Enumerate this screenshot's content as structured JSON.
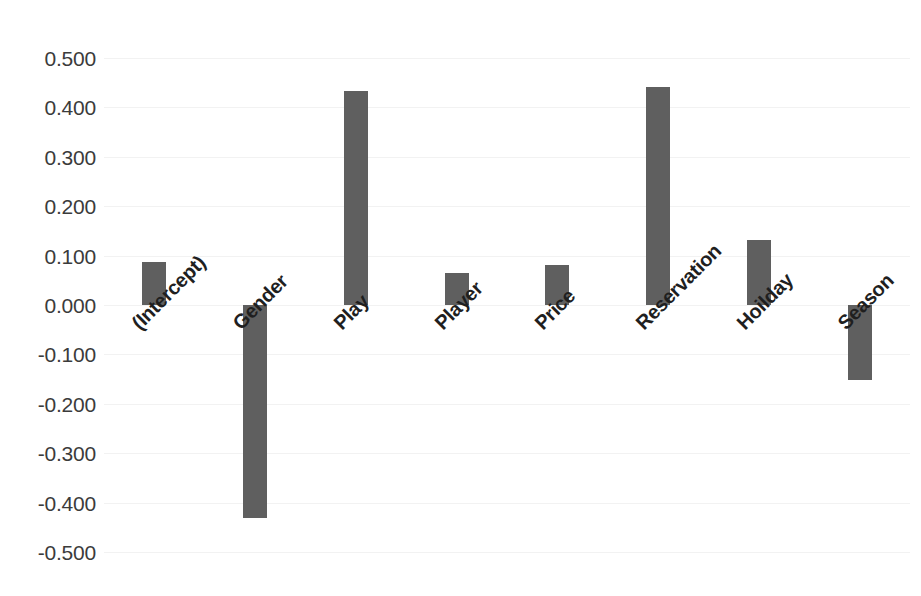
{
  "chart_data": {
    "type": "bar",
    "title": "",
    "subtitle": "",
    "xlabel": "",
    "ylabel": "",
    "categories": [
      "(Intercept)",
      "Gender",
      "Play",
      "Player",
      "Price",
      "Reservation",
      "Hoilday",
      "Season"
    ],
    "values": [
      0.088,
      -0.431,
      0.433,
      0.064,
      0.08,
      0.441,
      0.132,
      -0.151
    ],
    "ylim": [
      -0.5,
      0.5
    ],
    "yticks": [
      0.5,
      0.4,
      0.3,
      0.2,
      0.1,
      0.0,
      -0.1,
      -0.2,
      -0.3,
      -0.4,
      -0.5
    ],
    "ytick_labels": [
      "0.500",
      "0.400",
      "0.300",
      "0.200",
      "0.100",
      "0.000",
      "-0.100",
      "-0.200",
      "-0.300",
      "-0.400",
      "-0.500"
    ],
    "grid": true,
    "legend": false,
    "legend_position": "none",
    "bar_color": "#5f5f5f",
    "gridline_color": "#f2f2f2",
    "background_color": "#ffffff",
    "tick_label_rotation": -45,
    "bar_width_px": 24,
    "annotations": []
  }
}
